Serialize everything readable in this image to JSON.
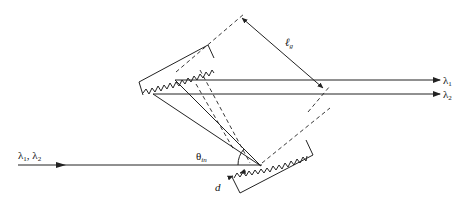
{
  "diagram": {
    "labels": {
      "input_beam": "λ1, λ2",
      "output_1": "λ1",
      "output_2": "λ2",
      "separation": "ℓg",
      "separation_main": "ℓ",
      "separation_sub": "g",
      "incidence_angle": "θin",
      "incidence_main": "θ",
      "incidence_sub": "in",
      "groove_spacing": "d"
    },
    "input_lambda_1_main": "λ",
    "input_lambda_1_sub": "1",
    "input_sep": ", ",
    "input_lambda_2_main": "λ",
    "input_lambda_2_sub": "2",
    "out1_main": "λ",
    "out1_sub": "1",
    "out2_main": "λ",
    "out2_sub": "2",
    "colors": {
      "stroke": "#222222",
      "background": "#ffffff"
    }
  }
}
